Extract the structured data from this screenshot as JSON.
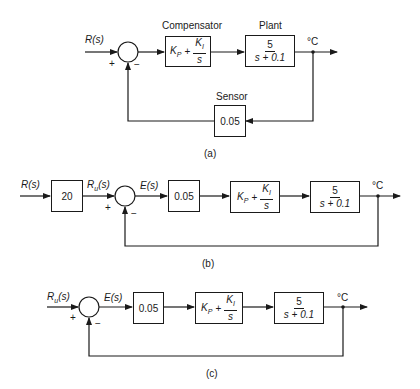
{
  "diagrams": [
    {
      "id": "a",
      "caption": "(a)",
      "input_label": "R(s)",
      "sum_signs": {
        "plus": "+",
        "minus": "−"
      },
      "compensator": {
        "title": "Compensator",
        "kp": "K",
        "kp_sub": "P",
        "plus": "+",
        "ki": "K",
        "ki_sub": "I",
        "den": "s"
      },
      "plant": {
        "title": "Plant",
        "num": "5",
        "den": "s + 0.1"
      },
      "sensor": {
        "title": "Sensor",
        "gain": "0.05"
      },
      "output_label": "°C"
    },
    {
      "id": "b",
      "caption": "(b)",
      "input_label": "R(s)",
      "prefilter_gain": "20",
      "ru_label": "R",
      "ru_sub": "u",
      "ru_arg": "(s)",
      "error_label": "E(s)",
      "sum_signs": {
        "plus": "+",
        "minus": "−"
      },
      "sensor_gain": "0.05",
      "compensator": {
        "kp": "K",
        "kp_sub": "P",
        "plus": "+",
        "ki": "K",
        "ki_sub": "I",
        "den": "s"
      },
      "plant": {
        "num": "5",
        "den": "s + 0.1"
      },
      "output_label": "°C"
    },
    {
      "id": "c",
      "caption": "(c)",
      "ru_label": "R",
      "ru_sub": "u",
      "ru_arg": "(s)",
      "error_label": "E(s)",
      "sum_signs": {
        "plus": "+",
        "minus": "−"
      },
      "sensor_gain": "0.05",
      "compensator": {
        "kp": "K",
        "kp_sub": "P",
        "plus": "+",
        "ki": "K",
        "ki_sub": "I",
        "den": "s"
      },
      "plant": {
        "num": "5",
        "den": "s + 0.1"
      },
      "output_label": "°C"
    }
  ]
}
